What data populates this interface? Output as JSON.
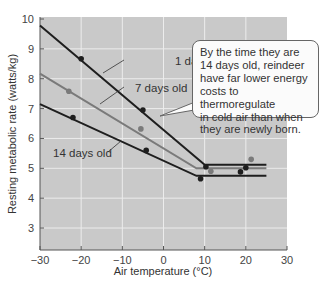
{
  "chart_data": {
    "type": "line",
    "title": "",
    "xlabel": "Air temperature (°C)",
    "ylabel": "Resting metabolic rate (watts/kg)",
    "xlim": [
      -30,
      30
    ],
    "ylim": [
      2.3,
      10
    ],
    "x_ticks": [
      -30,
      -20,
      -10,
      0,
      10,
      20,
      30
    ],
    "y_ticks": [
      3,
      4,
      5,
      6,
      7,
      8,
      9,
      10
    ],
    "grid": true,
    "legend": "inline labels",
    "series": [
      {
        "name": "1 day old",
        "color": "#1e1e1e",
        "line": [
          [
            -30,
            9.78
          ],
          [
            10,
            5.12
          ],
          [
            25,
            5.12
          ]
        ],
        "points": [
          [
            -20,
            8.67
          ],
          [
            -5,
            6.95
          ],
          [
            10.3,
            5.05
          ]
        ]
      },
      {
        "name": "7 days old",
        "color": "#7a7a7a",
        "line": [
          [
            -30,
            8.17
          ],
          [
            8,
            5.0
          ],
          [
            25,
            5.0
          ]
        ],
        "points": [
          [
            -23,
            7.58
          ],
          [
            -5.5,
            6.32
          ],
          [
            11.5,
            4.9
          ],
          [
            21.3,
            5.3
          ]
        ]
      },
      {
        "name": "14 days old",
        "color": "#1e1e1e",
        "line": [
          [
            -30,
            7.15
          ],
          [
            8,
            4.75
          ],
          [
            25,
            4.75
          ]
        ],
        "points": [
          [
            -22,
            6.7
          ],
          [
            -4.2,
            5.6
          ],
          [
            9,
            4.65
          ],
          [
            18.7,
            4.88
          ],
          [
            20,
            5.02
          ]
        ]
      }
    ],
    "annotations": [
      "1 day old",
      "7 days old",
      "14 days old",
      "By the time they are 14 days old, reindeer have far lower energy costs to thermoregulate in cold air than when they are newly born."
    ]
  },
  "labels": {
    "series_1": "1 day old",
    "series_7": "7 days old",
    "series_14": "14 days old",
    "xlabel": "Air temperature (°C)",
    "ylabel": "Resting metabolic rate (watts/kg)"
  },
  "callout": {
    "lines": [
      "By the time they are",
      "14 days old, reindeer",
      "have far lower energy",
      "costs to thermoregulate",
      "in cold air than when",
      "they are newly born."
    ]
  },
  "colors": {
    "plot_bg": "#c9c9c9",
    "grid": "#ececec",
    "dark_series": "#1e1e1e",
    "gray_series": "#7a7a7a"
  }
}
